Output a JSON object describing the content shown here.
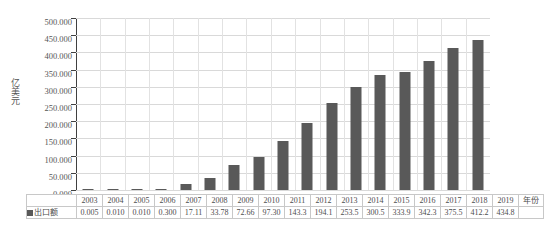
{
  "chart_data": {
    "type": "bar",
    "title": "",
    "xlabel": "年份",
    "ylabel": "亿美元",
    "ylim": [
      0,
      500
    ],
    "grid": true,
    "legend_position": "bottom-left-table",
    "series_name": "出口额",
    "categories": [
      "2003",
      "2004",
      "2005",
      "2006",
      "2007",
      "2008",
      "2009",
      "2010",
      "2011",
      "2012",
      "2013",
      "2014",
      "2015",
      "2016",
      "2017",
      "2018",
      "2019"
    ],
    "values": [
      0.005,
      0.01,
      0.01,
      0.3,
      17.11,
      33.78,
      72.66,
      97.3,
      143.3,
      194.1,
      253.5,
      300.5,
      333.9,
      342.3,
      375.5,
      412.2,
      434.8
    ],
    "value_labels": [
      "0.005",
      "0.010",
      "0.010",
      "0.300",
      "17.11",
      "33.78",
      "72.66",
      "97.30",
      "143.3",
      "194.1",
      "253.5",
      "300.5",
      "333.9",
      "342.3",
      "375.5",
      "412.2",
      "434.8"
    ],
    "ytick_labels": [
      "500.000",
      "450.000",
      "400.000",
      "350.000",
      "300.000",
      "250.000",
      "200.000",
      "150.000",
      "100.000",
      "50.000",
      "0.000"
    ],
    "ytick_values": [
      500,
      450,
      400,
      350,
      300,
      250,
      200,
      150,
      100,
      50,
      0
    ],
    "bar_color": "#595959",
    "gridline_color": "#d9d9d9",
    "axis_color": "#404040"
  },
  "table": {
    "legend_label": "出口额",
    "axis_name": "年份"
  }
}
